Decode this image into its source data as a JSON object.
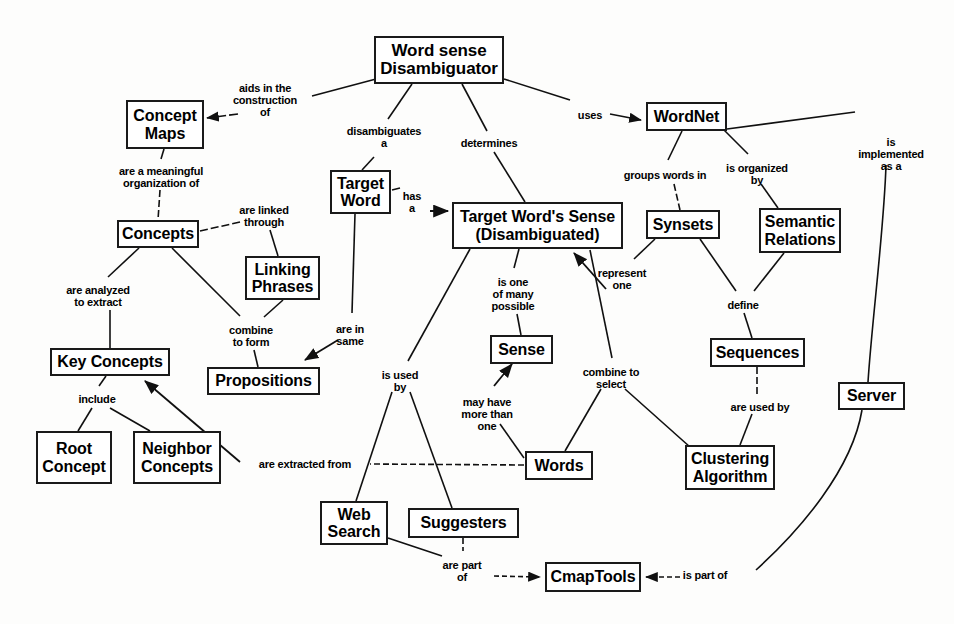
{
  "diagram": {
    "width": 954,
    "height": 624,
    "background_color": "#fdfdfc",
    "node_border_color": "#1a1a1a",
    "text_color": "#000000"
  },
  "nodes": [
    {
      "id": "wsd",
      "label": "Word sense\nDisambiguator",
      "x": 374,
      "y": 36,
      "w": 130,
      "h": 48,
      "font_size": 17
    },
    {
      "id": "concept_maps",
      "label": "Concept\nMaps",
      "x": 126,
      "y": 100,
      "w": 78,
      "h": 49,
      "font_size": 16
    },
    {
      "id": "wordnet",
      "label": "WordNet",
      "x": 646,
      "y": 102,
      "w": 81,
      "h": 29,
      "font_size": 16
    },
    {
      "id": "target_word",
      "label": "Target\nWord",
      "x": 330,
      "y": 170,
      "w": 61,
      "h": 44,
      "font_size": 16
    },
    {
      "id": "tws",
      "label": "Target Word's Sense\n(Disambiguated)",
      "x": 452,
      "y": 202,
      "w": 171,
      "h": 47,
      "font_size": 16
    },
    {
      "id": "synsets",
      "label": "Synsets",
      "x": 646,
      "y": 210,
      "w": 74,
      "h": 29,
      "font_size": 16
    },
    {
      "id": "semantic",
      "label": "Semantic\nRelations",
      "x": 759,
      "y": 208,
      "w": 82,
      "h": 45,
      "font_size": 16
    },
    {
      "id": "concepts",
      "label": "Concepts",
      "x": 117,
      "y": 220,
      "w": 82,
      "h": 28,
      "font_size": 16
    },
    {
      "id": "linking",
      "label": "Linking\nPhrases",
      "x": 245,
      "y": 256,
      "w": 75,
      "h": 44,
      "font_size": 16
    },
    {
      "id": "sequences",
      "label": "Sequences",
      "x": 710,
      "y": 338,
      "w": 95,
      "h": 29,
      "font_size": 16
    },
    {
      "id": "key_concepts",
      "label": "Key Concepts",
      "x": 50,
      "y": 348,
      "w": 120,
      "h": 28,
      "font_size": 16
    },
    {
      "id": "sense",
      "label": "Sense",
      "x": 490,
      "y": 335,
      "w": 63,
      "h": 29,
      "font_size": 16
    },
    {
      "id": "propositions",
      "label": "Propositions",
      "x": 207,
      "y": 367,
      "w": 113,
      "h": 28,
      "font_size": 16
    },
    {
      "id": "server",
      "label": "Server",
      "x": 838,
      "y": 382,
      "w": 67,
      "h": 28,
      "font_size": 16
    },
    {
      "id": "root_concept",
      "label": "Root\nConcept",
      "x": 36,
      "y": 431,
      "w": 76,
      "h": 53,
      "font_size": 16
    },
    {
      "id": "neighbor",
      "label": "Neighbor\nConcepts",
      "x": 133,
      "y": 431,
      "w": 88,
      "h": 53,
      "font_size": 16
    },
    {
      "id": "words",
      "label": "Words",
      "x": 525,
      "y": 451,
      "w": 68,
      "h": 29,
      "font_size": 16
    },
    {
      "id": "clustering",
      "label": "Clustering\nAlgorithm",
      "x": 685,
      "y": 445,
      "w": 90,
      "h": 45,
      "font_size": 16
    },
    {
      "id": "web_search",
      "label": "Web\nSearch",
      "x": 320,
      "y": 501,
      "w": 68,
      "h": 44,
      "font_size": 16
    },
    {
      "id": "suggesters",
      "label": "Suggesters",
      "x": 408,
      "y": 508,
      "w": 111,
      "h": 30,
      "font_size": 16
    },
    {
      "id": "cmaptools",
      "label": "CmapTools",
      "x": 545,
      "y": 562,
      "w": 96,
      "h": 30,
      "font_size": 16
    }
  ],
  "link_labels": [
    {
      "id": "aids",
      "text": "aids in the\nconstruction\nof",
      "x": 265,
      "y": 83
    },
    {
      "id": "uses",
      "text": "uses",
      "x": 590,
      "y": 110
    },
    {
      "id": "disambiguates",
      "text": "disambiguates\na",
      "x": 384,
      "y": 126
    },
    {
      "id": "determines",
      "text": "determines",
      "x": 489,
      "y": 138
    },
    {
      "id": "is_impl",
      "text": "is\nimplemented\nas a",
      "x": 891,
      "y": 137
    },
    {
      "id": "meaningful",
      "text": "are a meaningful\norganization of",
      "x": 161,
      "y": 166
    },
    {
      "id": "groups",
      "text": "groups words in",
      "x": 665,
      "y": 170
    },
    {
      "id": "organized",
      "text": "is organized\nby",
      "x": 757,
      "y": 163
    },
    {
      "id": "linked",
      "text": "are linked\nthrough",
      "x": 264,
      "y": 205
    },
    {
      "id": "has_a",
      "text": "has\na",
      "x": 412,
      "y": 191
    },
    {
      "id": "analyzed",
      "text": "are analyzed\nto extract",
      "x": 98,
      "y": 285
    },
    {
      "id": "one_of_many",
      "text": "is one\nof many\npossible",
      "x": 513,
      "y": 277
    },
    {
      "id": "represent",
      "text": "represent\none",
      "x": 622,
      "y": 268
    },
    {
      "id": "define",
      "text": "define",
      "x": 743,
      "y": 300
    },
    {
      "id": "combine_form",
      "text": "combine\nto form",
      "x": 251,
      "y": 325
    },
    {
      "id": "are_in_same",
      "text": "are in\nsame",
      "x": 350,
      "y": 324
    },
    {
      "id": "is_used_by",
      "text": "is used\nby",
      "x": 400,
      "y": 370
    },
    {
      "id": "combine_sel",
      "text": "combine to\nselect",
      "x": 611,
      "y": 367
    },
    {
      "id": "include",
      "text": "include",
      "x": 97,
      "y": 394
    },
    {
      "id": "may_have",
      "text": "may have\nmore than\none",
      "x": 487,
      "y": 397
    },
    {
      "id": "used_by",
      "text": "are used by",
      "x": 760,
      "y": 402
    },
    {
      "id": "extracted",
      "text": "are extracted from",
      "x": 305,
      "y": 459
    },
    {
      "id": "are_part_of",
      "text": "are part\nof",
      "x": 462,
      "y": 560
    },
    {
      "id": "is_part_of",
      "text": "is part of",
      "x": 705,
      "y": 570
    }
  ],
  "edges": [
    {
      "from": "wsd",
      "to": "aids",
      "arrow": false
    },
    {
      "from": "aids",
      "to": "concept_maps",
      "arrow": true
    },
    {
      "from": "wsd",
      "to": "uses",
      "arrow": false
    },
    {
      "from": "uses",
      "to": "wordnet",
      "arrow": true
    },
    {
      "from": "wsd",
      "to": "disambiguates",
      "arrow": false
    },
    {
      "from": "disambiguates",
      "to": "target_word",
      "arrow": false
    },
    {
      "from": "wsd",
      "to": "determines",
      "arrow": false
    },
    {
      "from": "determines",
      "to": "tws",
      "arrow": false
    },
    {
      "from": "concept_maps",
      "to": "meaningful",
      "arrow": false
    },
    {
      "from": "meaningful",
      "to": "concepts",
      "arrow": false
    },
    {
      "from": "concepts",
      "to": "linked",
      "arrow": false
    },
    {
      "from": "linked",
      "to": "linking",
      "arrow": false
    },
    {
      "from": "concepts",
      "to": "analyzed",
      "arrow": false
    },
    {
      "from": "analyzed",
      "to": "key_concepts",
      "arrow": false
    },
    {
      "from": "concepts",
      "to": "combine_form",
      "arrow": false
    },
    {
      "from": "linking",
      "to": "combine_form",
      "arrow": false
    },
    {
      "from": "combine_form",
      "to": "propositions",
      "arrow": false
    },
    {
      "from": "key_concepts",
      "to": "include",
      "arrow": false
    },
    {
      "from": "include",
      "to": "root_concept",
      "arrow": false
    },
    {
      "from": "include",
      "to": "neighbor",
      "arrow": false
    },
    {
      "from": "target_word",
      "to": "has_a",
      "arrow": false
    },
    {
      "from": "has_a",
      "to": "tws",
      "arrow": true
    },
    {
      "from": "target_word",
      "to": "are_in_same",
      "arrow": false
    },
    {
      "from": "are_in_same",
      "to": "propositions",
      "arrow": true
    },
    {
      "from": "wordnet",
      "to": "groups",
      "arrow": false
    },
    {
      "from": "groups",
      "to": "synsets",
      "arrow": false
    },
    {
      "from": "wordnet",
      "to": "organized",
      "arrow": false
    },
    {
      "from": "organized",
      "to": "semantic",
      "arrow": false
    },
    {
      "from": "wordnet",
      "to": "is_impl",
      "arrow": false
    },
    {
      "from": "is_impl",
      "to": "server",
      "arrow": false
    },
    {
      "from": "tws",
      "to": "one_of_many",
      "arrow": false
    },
    {
      "from": "one_of_many",
      "to": "sense",
      "arrow": false
    },
    {
      "from": "synsets",
      "to": "represent",
      "arrow": false
    },
    {
      "from": "represent",
      "to": "tws",
      "arrow": true
    },
    {
      "from": "synsets",
      "to": "define",
      "arrow": false
    },
    {
      "from": "semantic",
      "to": "define",
      "arrow": false
    },
    {
      "from": "define",
      "to": "sequences",
      "arrow": false
    },
    {
      "from": "sequences",
      "to": "used_by",
      "arrow": false
    },
    {
      "from": "used_by",
      "to": "clustering",
      "arrow": false
    },
    {
      "from": "tws",
      "to": "is_used_by",
      "arrow": false
    },
    {
      "from": "is_used_by",
      "to": "web_search",
      "arrow": false
    },
    {
      "from": "is_used_by",
      "to": "suggesters",
      "arrow": false
    },
    {
      "from": "words",
      "to": "may_have",
      "arrow": false
    },
    {
      "from": "may_have",
      "to": "sense",
      "arrow": true
    },
    {
      "from": "tws",
      "to": "combine_sel",
      "arrow": false
    },
    {
      "from": "combine_sel",
      "to": "words",
      "arrow": false
    },
    {
      "from": "combine_sel",
      "to": "clustering",
      "arrow": false
    },
    {
      "from": "words",
      "to": "extracted",
      "arrow": false
    },
    {
      "from": "extracted",
      "to": "key_concepts",
      "arrow": true
    },
    {
      "from": "web_search",
      "to": "are_part_of",
      "arrow": false
    },
    {
      "from": "suggesters",
      "to": "are_part_of",
      "arrow": false
    },
    {
      "from": "are_part_of",
      "to": "cmaptools",
      "arrow": true
    },
    {
      "from": "server",
      "to": "is_part_of",
      "arrow": false
    },
    {
      "from": "is_part_of",
      "to": "cmaptools",
      "arrow": true
    }
  ]
}
